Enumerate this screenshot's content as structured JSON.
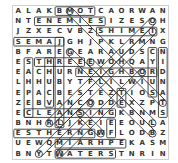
{
  "puzzle": {
    "type": "word-search",
    "rows": 15,
    "cols": 15,
    "grid": [
      "ALAKBMOTCAORWAN",
      "NTENEMIESIZESOH",
      "JZXECVBZSHIMEIX",
      "SEMAJGHJPKLRMNG",
      "BFAREGEARAUDSCN",
      "ESTHREEEWOHQAYI",
      "EACHURNEIGHBORD",
      "LHHUBYTFLILWIUN",
      "EPACBESTEZTIOSA",
      "ZEBVANCODDEXZPT",
      "ECLEANSINGKBNMS",
      "BNHRLJKEIEEOULA",
      "ESTHERNGWFLODBZ",
      "UEWQMIARHPEKASM",
      "BNYTWATERSTNRIN"
    ],
    "boxes": [
      {
        "r1": 0,
        "c1": 4,
        "r2": 0,
        "c2": 7
      },
      {
        "r1": 1,
        "c1": 2,
        "r2": 1,
        "c2": 8
      },
      {
        "r1": 2,
        "c1": 8,
        "r2": 2,
        "c2": 13
      },
      {
        "r1": 3,
        "c1": 0,
        "r2": 3,
        "c2": 4
      },
      {
        "r1": 3,
        "c1": 4,
        "r2": 11,
        "c2": 4
      },
      {
        "r1": 5,
        "c1": 2,
        "r2": 5,
        "c2": 6
      },
      {
        "r1": 5,
        "c1": 1,
        "r2": 10,
        "c2": 1
      },
      {
        "r1": 5,
        "c1": 3,
        "r2": 9,
        "c2": 3
      },
      {
        "r1": 6,
        "c1": 6,
        "r2": 6,
        "c2": 13
      },
      {
        "r1": 4,
        "c1": 13,
        "r2": 8,
        "c2": 13
      },
      {
        "r1": 8,
        "c1": 10,
        "r2": 9,
        "c2": 10
      },
      {
        "r1": 10,
        "c1": 1,
        "r2": 10,
        "c2": 9
      },
      {
        "r1": 12,
        "c1": 0,
        "r2": 12,
        "c2": 7
      },
      {
        "r1": 11,
        "c1": 9,
        "r2": 12,
        "c2": 9
      },
      {
        "r1": 13,
        "c1": 4,
        "r2": 13,
        "c2": 10
      },
      {
        "r1": 14,
        "c1": 4,
        "r2": 14,
        "c2": 9
      },
      {
        "r1": 4,
        "c1": 14,
        "r2": 10,
        "c2": 14
      }
    ],
    "lines": [
      {
        "r1": 0,
        "c1": 5,
        "r2": 9,
        "c2": 14
      },
      {
        "r1": 1,
        "c1": 13,
        "r2": 11,
        "c2": 3
      },
      {
        "r1": 2,
        "c1": 13,
        "r2": 11,
        "c2": 4
      },
      {
        "r1": 4,
        "c1": 5,
        "r2": 12,
        "c2": 13
      },
      {
        "r1": 5,
        "c1": 7,
        "r2": 11,
        "c2": 13
      },
      {
        "r1": 9,
        "c1": 7,
        "r2": 14,
        "c2": 2
      },
      {
        "r1": 6,
        "c1": 12,
        "r2": 14,
        "c2": 4
      },
      {
        "r1": 10,
        "c1": 6,
        "r2": 12,
        "c2": 8
      }
    ],
    "line_color": "#333333"
  }
}
